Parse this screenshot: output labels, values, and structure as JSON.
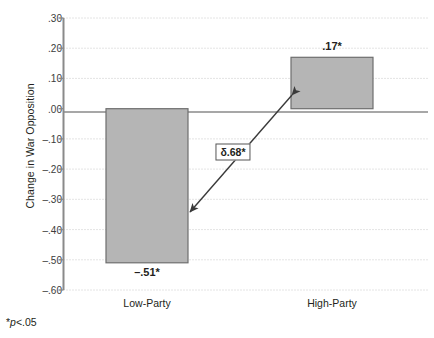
{
  "chart_data": {
    "type": "bar",
    "title": "",
    "subtitle": "",
    "xlabel": "",
    "ylabel": "Change in War Opposition",
    "categories": [
      "Low-Party",
      "High-Party"
    ],
    "values": [
      -0.51,
      0.17
    ],
    "value_labels": [
      "–.51*",
      ".17*"
    ],
    "ylim": [
      -0.6,
      0.3
    ],
    "ytick_values": [
      0.3,
      0.2,
      0.1,
      0.0,
      -0.1,
      -0.2,
      -0.3,
      -0.4,
      -0.5,
      -0.6
    ],
    "ytick_labels": [
      ".30",
      ".20",
      ".10",
      ".00",
      "–.10",
      "–.20",
      "–.30",
      "–.40",
      "–.50",
      "–.60"
    ],
    "grid": true,
    "grid_style": "dotted",
    "legend": "none",
    "annotations": [
      {
        "name": "delta-difference",
        "text": "δ.68*",
        "kind": "boxed-label-with-double-arrow",
        "connects": [
          "Low-Party",
          "High-Party"
        ]
      }
    ],
    "footnote": "*p<.05",
    "colors": {
      "bar_fill": "#b5b5b5",
      "bar_border": "#6e6e6e",
      "axis": "#808080",
      "grid": "#c8c8c8",
      "text": "#231f20"
    }
  },
  "footnote": {
    "star": "*",
    "p": "p",
    "rest": "<.05"
  },
  "annotation": {
    "delta_label": "δ.68*"
  }
}
